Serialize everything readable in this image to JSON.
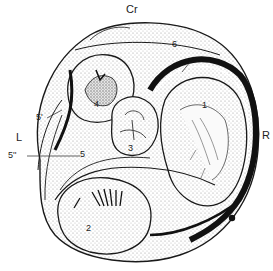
{
  "figure": {
    "orientation_labels": {
      "cranial": "Cr",
      "left": "L",
      "right": "R"
    },
    "structure_labels": [
      {
        "id": "1",
        "text": "1"
      },
      {
        "id": "2",
        "text": "2"
      },
      {
        "id": "3",
        "text": "3"
      },
      {
        "id": "4",
        "text": "4"
      },
      {
        "id": "5",
        "text": "5"
      },
      {
        "id": "5p",
        "text": "5'"
      },
      {
        "id": "5pp",
        "text": "5''"
      },
      {
        "id": "6",
        "text": "6"
      }
    ],
    "colors": {
      "ink": "#1a1a1a",
      "paper": "#ffffff",
      "stipple": "#bdbdbd"
    }
  }
}
